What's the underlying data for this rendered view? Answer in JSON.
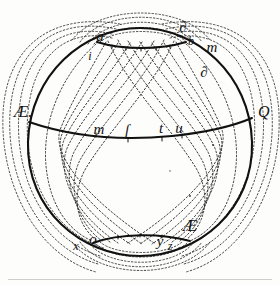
{
  "figure": {
    "kind": "engraved-diagram",
    "colors": {
      "background": "#fdfdfc",
      "ink": "#111111",
      "dotted_ink": "#2b2b2b",
      "page_rule": "#cfcfcc"
    },
    "sphere": {
      "center_x": 140,
      "center_y": 143,
      "radius_x": 112,
      "radius_y": 115
    }
  },
  "labels": {
    "equator_left": "Æ.",
    "equator_right": "Q",
    "north_left_upper": "a",
    "north_left_lower": "i",
    "north_right_upper": "∂",
    "north_right_lower": "b",
    "north_far_right": "m",
    "upper_right_mid": "∂",
    "equator_m": "m",
    "equator_s": "ſ",
    "equator_t": "t",
    "equator_u": "u",
    "south_left_x": "x",
    "south_left_o": "o",
    "south_right_y": "y",
    "south_right_z": "z",
    "south_right_cap": "Æ"
  },
  "label_positions": {
    "equator_left": {
      "x": 14,
      "y": 117
    },
    "equator_right": {
      "x": 258,
      "y": 117
    },
    "north_left_upper": {
      "x": 100,
      "y": 41
    },
    "north_left_lower": {
      "x": 90,
      "y": 60
    },
    "north_right_upper": {
      "x": 183,
      "y": 32
    },
    "north_right_lower": {
      "x": 191,
      "y": 45
    },
    "north_far_right": {
      "x": 212,
      "y": 52
    },
    "upper_right_mid": {
      "x": 204,
      "y": 77
    },
    "equator_m": {
      "x": 99,
      "y": 134
    },
    "equator_s": {
      "x": 127,
      "y": 135
    },
    "equator_t": {
      "x": 161,
      "y": 133
    },
    "equator_u": {
      "x": 179,
      "y": 133
    },
    "south_left_x": {
      "x": 76,
      "y": 250
    },
    "south_left_o": {
      "x": 93,
      "y": 244
    },
    "south_right_y": {
      "x": 160,
      "y": 246
    },
    "south_right_z": {
      "x": 170,
      "y": 250
    },
    "south_right_cap": {
      "x": 190,
      "y": 231
    }
  },
  "structure": {
    "outline_label": "sphere outline",
    "equator_label": "equator great circle",
    "arctic_label": "arctic small circle",
    "antarctic_label": "antarctic small circle",
    "meridian_count_inner": 14,
    "outer_loop_count": 8
  }
}
